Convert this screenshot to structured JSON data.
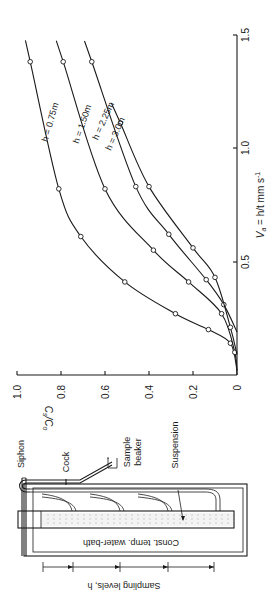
{
  "figure": {
    "orientation": "rotated 90 degrees counter-clockwise",
    "apparatus": {
      "labels": {
        "siphon": "Siphon",
        "cock": "Cock",
        "sample": "Sample",
        "beaker": "beaker",
        "suspension": "Suspension",
        "bath": "Const. temp. water-bath",
        "sampling_levels": "Sampling levels, h"
      }
    },
    "colors": {
      "ink": "#1a1a1a",
      "background": "#ffffff"
    }
  },
  "chart_data": {
    "type": "line",
    "title": "",
    "xlabel": "V_a = h/t mm s^-1",
    "xlabel_main": "V",
    "xlabel_sub": "a",
    "xlabel_rest": " = h/t mm s",
    "xlabel_sup": "-1",
    "ylabel": "C_s/C_0",
    "ylabel_main": "C",
    "ylabel_sub1": "s",
    "ylabel_mid": "/C",
    "ylabel_sub2": "o",
    "xlim": [
      0,
      1.5
    ],
    "ylim": [
      0,
      1.0
    ],
    "x_ticks": [
      "0.5",
      "1.0",
      "1.5"
    ],
    "y_ticks": [
      "1.0",
      "0.8",
      "0.6",
      "0.4",
      "0.2",
      "0"
    ],
    "grid": false,
    "legend": "inline curve labels",
    "series": [
      {
        "name": "h = 0.75m",
        "x": [
          0.14,
          0.2,
          0.27,
          0.41,
          0.61,
          0.82,
          1.38
        ],
        "y": [
          0.03,
          0.13,
          0.28,
          0.51,
          0.71,
          0.81,
          0.94
        ]
      },
      {
        "name": "h = 1.50m",
        "x": [
          0.1,
          0.27,
          0.41,
          0.55,
          0.82,
          1.38
        ],
        "y": [
          0.01,
          0.07,
          0.22,
          0.38,
          0.6,
          0.79
        ]
      },
      {
        "name": "h = 2.25m",
        "x": [
          0.31,
          0.42,
          0.62,
          0.83,
          1.38
        ],
        "y": [
          0.06,
          0.14,
          0.31,
          0.46,
          0.66
        ]
      },
      {
        "name": "h = 3.0m",
        "x": [
          0.21,
          0.43,
          0.56,
          0.83,
          1.11
        ],
        "y": [
          0.03,
          0.1,
          0.2,
          0.4,
          0.53
        ]
      }
    ]
  }
}
